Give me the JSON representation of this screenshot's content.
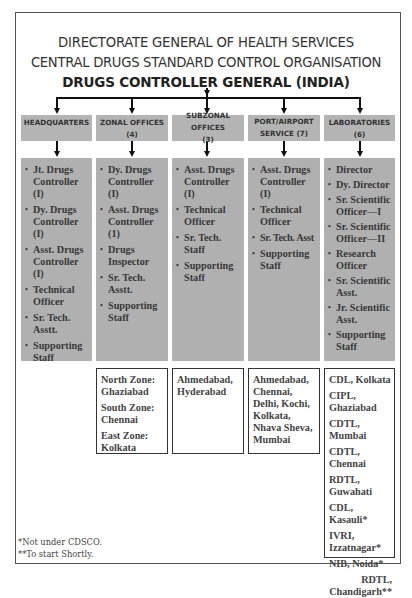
{
  "header": {
    "line1": "DIRECTORATE GENERAL OF HEALTH SERVICES",
    "line2": "CENTRAL DRUGS STANDARD CONTROL ORGANISATION",
    "line3": "DRUGS CONTROLLER GENERAL (INDIA)"
  },
  "columns": [
    {
      "title": "HEADQUARTERS",
      "items": [
        "Jt. Drugs Controller (I)",
        "Dy. Drugs Controller (I)",
        "Asst. Drugs Controller (I)",
        "Technical Officer",
        "Sr. Tech. Asstt.",
        "Supporting Staff"
      ]
    },
    {
      "title": "ZONAL OFFICES (4)",
      "items": [
        "Dy. Drugs Controller (I)",
        "Asst. Drugs Controller (1)",
        "Drugs Inspector",
        "Sr. Tech. Asstt.",
        "Supporting Staff"
      ],
      "locations": [
        "North Zone:",
        "Ghaziabad",
        "South Zone:",
        "Chennai",
        "East Zone:",
        "Kolkata"
      ]
    },
    {
      "title": "SUBZONAL OFFICES (3)",
      "items": [
        "Asst. Drugs Controller (I)",
        "Technical Officer",
        "Sr. Tech. Staff",
        "Supporting Staff"
      ],
      "locations": [
        "Ahmedabad,",
        "Hyderabad"
      ]
    },
    {
      "title": "PORT/AIRPORT SERVICE (7)",
      "items": [
        "Asst. Drugs Controller (I)",
        "Technical Officer",
        "Sr. Tech. Asst",
        "Supporting Staff"
      ],
      "locations": [
        "Ahmedabad,",
        "Chennai,",
        "Delhi, Kochi,",
        "Kolkata,",
        "Nhava Sheva,",
        "Mumbai"
      ]
    },
    {
      "title": "LABORATORIES (6)",
      "items": [
        "Director",
        "Dy. Director",
        "Sr. Scientific Officer—I",
        "Sr. Scientific Officer—II",
        "Research Officer",
        "Sr. Scientific Asst.",
        "Jr. Scientific Asst.",
        "Supporting Staff"
      ],
      "locations": [
        "CDL, Kolkata",
        "CIPL, Ghaziabad",
        "CDTL, Mumbai",
        "CDTL, Chennai",
        "RDTL, Guwahati",
        "CDL, Kasauli*",
        "IVRI, Izzatnagar*",
        "NIB, Noida*",
        "RDTL, Chandigarh**"
      ]
    }
  ],
  "footnotes": {
    "note1": "*Not under CDSCO.",
    "note2": "**To start Shortly."
  }
}
